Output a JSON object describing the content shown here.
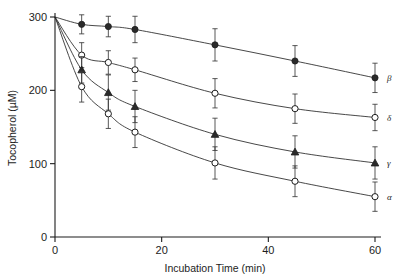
{
  "chart_data": {
    "type": "line",
    "title": "",
    "xlabel": "Incubation Time (min)",
    "ylabel": "Tocopherol (µM)",
    "xlim": [
      0,
      60
    ],
    "ylim": [
      0,
      300
    ],
    "xticks": [
      0,
      20,
      40,
      60
    ],
    "yticks": [
      0,
      100,
      200,
      300
    ],
    "xticklabels": [
      "0",
      "20",
      "40",
      "60"
    ],
    "yticklabels": [
      "0",
      "100",
      "200",
      "300"
    ],
    "grid": false,
    "legend_position": "right-of-endpoints",
    "x": [
      0,
      5,
      10,
      15,
      30,
      45,
      60
    ],
    "series": [
      {
        "name": "β",
        "label": "β",
        "marker": "filled-circle",
        "values": [
          300,
          290,
          287,
          283,
          262,
          240,
          217
        ],
        "errors": [
          0,
          13,
          14,
          18,
          22,
          21,
          20
        ],
        "color": "#1d1d1d"
      },
      {
        "name": "δ",
        "label": "δ",
        "marker": "open-circle",
        "values": [
          300,
          248,
          238,
          228,
          196,
          175,
          163
        ],
        "errors": [
          0,
          17,
          16,
          16,
          20,
          20,
          18
        ],
        "color": "#1d1d1d"
      },
      {
        "name": "γ",
        "label": "γ",
        "marker": "filled-triangle",
        "values": [
          300,
          228,
          197,
          178,
          140,
          116,
          101
        ],
        "errors": [
          0,
          18,
          24,
          22,
          22,
          22,
          22
        ],
        "color": "#1d1d1d"
      },
      {
        "name": "α",
        "label": "α",
        "marker": "open-circle",
        "values": [
          300,
          205,
          168,
          143,
          101,
          76,
          55
        ],
        "errors": [
          0,
          21,
          20,
          21,
          22,
          21,
          20
        ],
        "color": "#1d1d1d"
      }
    ]
  },
  "axes": {
    "x_title": "Incubation Time (min)",
    "y_title": "Tocopherol (µM)"
  }
}
